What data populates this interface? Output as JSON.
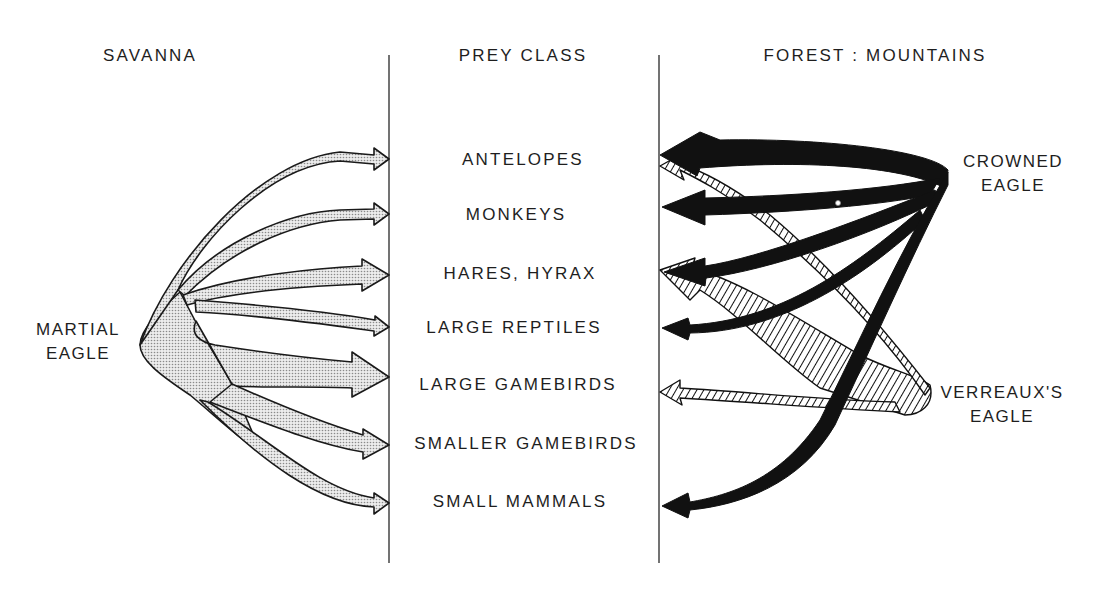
{
  "headers": {
    "left": "SAVANNA",
    "center": "PREY CLASS",
    "right": "FOREST : MOUNTAINS"
  },
  "predators": {
    "martial": {
      "line1": "MARTIAL",
      "line2": "EAGLE",
      "habitat": "SAVANNA",
      "fill": "dotted-grey"
    },
    "crowned": {
      "line1": "CROWNED",
      "line2": "EAGLE",
      "habitat": "FOREST : MOUNTAINS",
      "fill": "solid-black"
    },
    "verreaux": {
      "line1": "VERREAUX'S",
      "line2": "EAGLE",
      "habitat": "FOREST : MOUNTAINS",
      "fill": "hatched"
    }
  },
  "prey_classes": [
    {
      "label": "ANTELOPES"
    },
    {
      "label": "MONKEYS"
    },
    {
      "label": "HARES, HYRAX"
    },
    {
      "label": "LARGE REPTILES"
    },
    {
      "label": "LARGE GAMEBIRDS"
    },
    {
      "label": "SMALLER GAMEBIRDS"
    },
    {
      "label": "SMALL MAMMALS"
    }
  ],
  "links": {
    "martial": [
      {
        "prey": "ANTELOPES",
        "width": "thin"
      },
      {
        "prey": "MONKEYS",
        "width": "medium"
      },
      {
        "prey": "HARES, HYRAX",
        "width": "thick"
      },
      {
        "prey": "LARGE REPTILES",
        "width": "medium"
      },
      {
        "prey": "LARGE GAMEBIRDS",
        "width": "thick"
      },
      {
        "prey": "SMALLER GAMEBIRDS",
        "width": "thick"
      },
      {
        "prey": "SMALL MAMMALS",
        "width": "thin"
      }
    ],
    "crowned": [
      {
        "prey": "ANTELOPES",
        "width": "very-thick"
      },
      {
        "prey": "MONKEYS",
        "width": "thick"
      },
      {
        "prey": "HARES, HYRAX",
        "width": "medium"
      },
      {
        "prey": "LARGE REPTILES",
        "width": "medium"
      },
      {
        "prey": "SMALL MAMMALS",
        "width": "medium"
      }
    ],
    "verreaux": [
      {
        "prey": "ANTELOPES",
        "width": "thin"
      },
      {
        "prey": "HARES, HYRAX",
        "width": "very-thick"
      },
      {
        "prey": "LARGE GAMEBIRDS",
        "width": "thin"
      }
    ]
  },
  "colors": {
    "ink": "#111111",
    "dot_fill": "#d9d9d9",
    "line": "#333333"
  }
}
